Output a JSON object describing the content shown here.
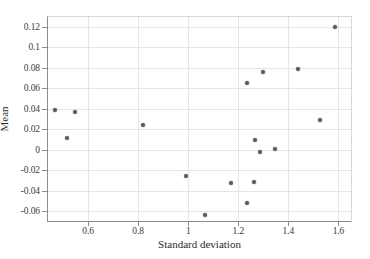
{
  "chart_data": {
    "type": "scatter",
    "title": "",
    "xlabel": "Standard deviation",
    "ylabel": "Mean",
    "xlim": [
      0.44,
      1.65
    ],
    "ylim": [
      -0.0695,
      0.1295
    ],
    "xticks": [
      0.6,
      0.8,
      1,
      1.2,
      1.4,
      1.6
    ],
    "xtick_labels": [
      "0.6",
      "0.8",
      "1",
      "1.2",
      "1.4",
      "1.6"
    ],
    "yticks": [
      0.12,
      0.1,
      0.08,
      0.06,
      0.04,
      0.02,
      0,
      -0.02,
      -0.04,
      -0.06
    ],
    "ytick_labels": [
      "0.12",
      "0.1",
      "0.08",
      "0.06",
      "0.04",
      "0.02",
      "0",
      "-0.02",
      "-0.04",
      "-0.06"
    ],
    "grid": true,
    "legend": null,
    "marker_color": "#555a63",
    "points": [
      {
        "x": 0.467,
        "y": 0.039
      },
      {
        "x": 0.515,
        "y": 0.0113
      },
      {
        "x": 0.547,
        "y": 0.0367
      },
      {
        "x": 0.818,
        "y": 0.024
      },
      {
        "x": 0.993,
        "y": -0.0259
      },
      {
        "x": 1.068,
        "y": -0.0632
      },
      {
        "x": 1.172,
        "y": -0.0322
      },
      {
        "x": 1.233,
        "y": 0.0655
      },
      {
        "x": 1.235,
        "y": -0.0522
      },
      {
        "x": 1.262,
        "y": -0.0315
      },
      {
        "x": 1.266,
        "y": 0.01
      },
      {
        "x": 1.287,
        "y": -0.0023
      },
      {
        "x": 1.297,
        "y": 0.0758
      },
      {
        "x": 1.345,
        "y": 0.0011
      },
      {
        "x": 1.44,
        "y": 0.0792
      },
      {
        "x": 1.528,
        "y": 0.0291
      },
      {
        "x": 1.585,
        "y": 0.1193
      }
    ]
  }
}
